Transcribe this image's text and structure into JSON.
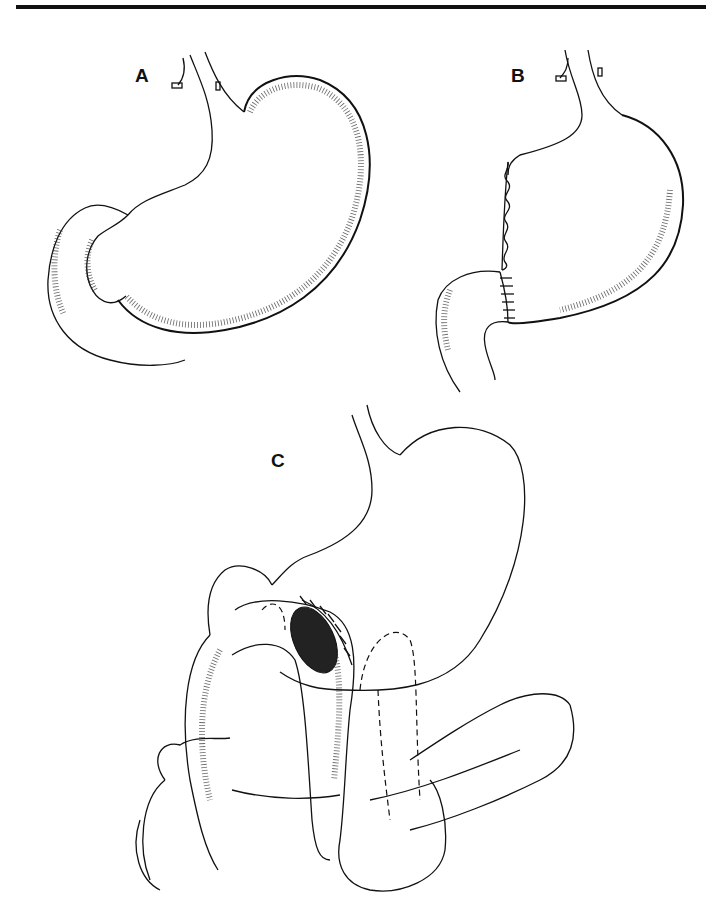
{
  "figure": {
    "panels": [
      {
        "id": "A",
        "label": "A",
        "description": "Normal stomach with duodenum"
      },
      {
        "id": "B",
        "label": "B",
        "description": "Partial gastrectomy with sutured lesser curvature and gastroduodenal anastomosis"
      },
      {
        "id": "C",
        "label": "C",
        "description": "Gastrojejunostomy with jejunal loop over transverse colon"
      }
    ],
    "colors": {
      "ink": "#111111",
      "background": "#ffffff"
    }
  }
}
